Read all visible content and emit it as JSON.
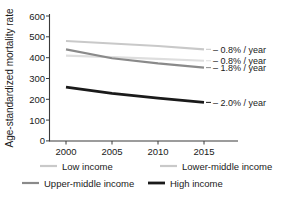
{
  "chart_data": {
    "type": "line",
    "title": "",
    "xlabel": "",
    "ylabel": "Age-standardized mortality rate",
    "x": [
      2000,
      2005,
      2010,
      2015
    ],
    "xlim": [
      1998,
      2017
    ],
    "ylim": [
      0,
      600
    ],
    "xticks": [
      2000,
      2005,
      2010,
      2015
    ],
    "xticklabels": [
      "2000",
      "2005",
      "2010",
      "2015"
    ],
    "yticks": [
      0,
      100,
      200,
      300,
      400,
      500,
      600
    ],
    "yticklabels": [
      "0",
      "100",
      "200",
      "300",
      "400",
      "500",
      "600"
    ],
    "grid": false,
    "legend_position": "below",
    "series": [
      {
        "name": "Low income",
        "color": "#c9c9c9",
        "width": 2.2,
        "values": [
          480,
          468,
          456,
          440
        ],
        "annotation": "– 0.8% / year"
      },
      {
        "name": "Lower-middle income",
        "color": "#dedede",
        "width": 2.2,
        "values": [
          410,
          402,
          394,
          385
        ],
        "annotation": "– 0.8% / year"
      },
      {
        "name": "Upper-middle income",
        "color": "#8a8a8a",
        "width": 2.2,
        "values": [
          440,
          397,
          372,
          352
        ],
        "annotation": "– 1.8% / year"
      },
      {
        "name": "High income",
        "color": "#1a1a1a",
        "width": 2.8,
        "values": [
          258,
          228,
          205,
          185
        ],
        "annotation": "– 2.0% / year"
      }
    ],
    "annotations": [
      {
        "text": "– 0.8% / year",
        "series": "Low income",
        "y": 440
      },
      {
        "text": "– 0.8% / year",
        "series": "Lower-middle income",
        "y": 385
      },
      {
        "text": "– 1.8% / year",
        "series": "Upper-middle income",
        "y": 352
      },
      {
        "text": "– 2.0% / year",
        "series": "High income",
        "y": 185
      }
    ],
    "legend": [
      {
        "label": "Low income",
        "color": "#c9c9c9",
        "width": 2.2
      },
      {
        "label": "Lower-middle income",
        "color": "#c9c9c9",
        "width": 2.2
      },
      {
        "label": "Upper-middle income",
        "color": "#8a8a8a",
        "width": 2.2
      },
      {
        "label": "High income",
        "color": "#1a1a1a",
        "width": 2.8
      }
    ]
  }
}
